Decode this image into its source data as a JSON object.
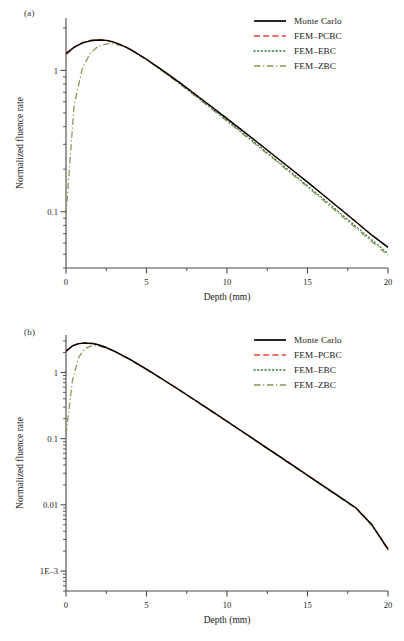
{
  "figure": {
    "panels": [
      {
        "tag": "(a)",
        "xlabel": "Depth (mm)",
        "ylabel": "Normalized fluence rate"
      },
      {
        "tag": "(b)",
        "xlabel": "Depth (mm)",
        "ylabel": "Normalized fluence rate"
      }
    ],
    "legend": {
      "entries": [
        {
          "label": "Monte Carlo",
          "color": "#000000",
          "style": "solid"
        },
        {
          "label": "FEM–PCBC",
          "color": "#e8413a",
          "style": "dashed"
        },
        {
          "label": "FEM–EBC",
          "color": "#2f7d3a",
          "style": "dotted"
        },
        {
          "label": "FEM–ZBC",
          "color": "#8f9152",
          "style": "dashdot"
        }
      ]
    }
  },
  "chart_data": [
    {
      "type": "line",
      "title": "(a)",
      "xlabel": "Depth (mm)",
      "ylabel": "Normalized fluence rate",
      "xlim": [
        0,
        20
      ],
      "ylim": [
        0.04,
        2.2
      ],
      "yscale": "log",
      "xticks": [
        0,
        5,
        10,
        15,
        20
      ],
      "xticklabels": [
        "0",
        "5",
        "10",
        "15",
        "20"
      ],
      "xminorticks": [
        2.5,
        7.5,
        12.5,
        17.5
      ],
      "yticks": [
        1,
        0.1
      ],
      "yticklabels": [
        "1",
        "0.1"
      ],
      "grid": false,
      "legend_position": "top-right",
      "x": [
        0,
        0.5,
        1,
        1.5,
        2,
        2.5,
        3,
        3.5,
        4,
        5,
        6,
        7,
        8,
        9,
        10,
        11,
        12,
        13,
        14,
        15,
        16,
        17,
        18,
        19,
        20
      ],
      "series": [
        {
          "name": "Monte Carlo",
          "color": "#000000",
          "style": "solid",
          "values": [
            1.32,
            1.46,
            1.56,
            1.62,
            1.64,
            1.63,
            1.58,
            1.5,
            1.41,
            1.2,
            1.0,
            0.83,
            0.68,
            0.558,
            0.456,
            0.372,
            0.303,
            0.246,
            0.2,
            0.162,
            0.131,
            0.1055,
            0.085,
            0.0683,
            0.056
          ]
        },
        {
          "name": "FEM–PCBC",
          "color": "#e8413a",
          "style": "dashed",
          "values": [
            1.29,
            1.45,
            1.57,
            1.63,
            1.66,
            1.64,
            1.59,
            1.51,
            1.41,
            1.2,
            1.0,
            0.83,
            0.681,
            0.558,
            0.456,
            0.372,
            0.303,
            0.246,
            0.2,
            0.162,
            0.131,
            0.1055,
            0.085,
            0.0683,
            0.0562
          ]
        },
        {
          "name": "FEM–EBC",
          "color": "#2f7d3a",
          "style": "dotted",
          "values": [
            1.3,
            1.45,
            1.56,
            1.62,
            1.64,
            1.63,
            1.58,
            1.5,
            1.4,
            1.19,
            0.99,
            0.818,
            0.668,
            0.545,
            0.443,
            0.359,
            0.291,
            0.235,
            0.19,
            0.153,
            0.123,
            0.0985,
            0.079,
            0.0632,
            0.0508
          ]
        },
        {
          "name": "FEM–ZBC",
          "color": "#8f9152",
          "style": "dashdot",
          "values": [
            0.095,
            0.56,
            1.02,
            1.32,
            1.48,
            1.54,
            1.54,
            1.49,
            1.4,
            1.19,
            0.985,
            0.812,
            0.662,
            0.539,
            0.437,
            0.354,
            0.286,
            0.231,
            0.186,
            0.15,
            0.12,
            0.096,
            0.0768,
            0.0613,
            0.0492
          ]
        }
      ]
    },
    {
      "type": "line",
      "title": "(b)",
      "xlabel": "Depth (mm)",
      "ylabel": "Normalized fluence rate",
      "xlim": [
        0,
        20
      ],
      "ylim": [
        0.0005,
        3.2
      ],
      "yscale": "log",
      "xticks": [
        0,
        5,
        10,
        15,
        20
      ],
      "xticklabels": [
        "0",
        "5",
        "10",
        "15",
        "20"
      ],
      "xminorticks": [
        2.5,
        7.5,
        12.5,
        17.5
      ],
      "yticks": [
        1,
        0.1,
        0.01,
        0.001
      ],
      "yticklabels": [
        "1",
        "0.1",
        "0.01",
        "1E–3"
      ],
      "grid": false,
      "legend_position": "top-right",
      "x": [
        0,
        0.4,
        0.8,
        1.2,
        1.6,
        2,
        2.5,
        3,
        4,
        5,
        6,
        7,
        8,
        9,
        10,
        11,
        12,
        13,
        14,
        15,
        16,
        17,
        18,
        19,
        20
      ],
      "series": [
        {
          "name": "Monte Carlo",
          "color": "#000000",
          "style": "solid",
          "values": [
            2.1,
            2.52,
            2.72,
            2.78,
            2.74,
            2.62,
            2.38,
            2.1,
            1.56,
            1.12,
            0.79,
            0.552,
            0.383,
            0.265,
            0.183,
            0.126,
            0.0865,
            0.0594,
            0.0408,
            0.028,
            0.0192,
            0.0132,
            0.00905,
            0.005,
            0.00215
          ]
        },
        {
          "name": "FEM–PCBC",
          "color": "#e8413a",
          "style": "dashed",
          "values": [
            2.06,
            2.54,
            2.76,
            2.82,
            2.77,
            2.64,
            2.39,
            2.11,
            1.57,
            1.12,
            0.792,
            0.553,
            0.384,
            0.266,
            0.183,
            0.126,
            0.0868,
            0.0596,
            0.0409,
            0.0281,
            0.0193,
            0.0132,
            0.00908,
            0.00502,
            0.00218
          ]
        },
        {
          "name": "FEM–EBC",
          "color": "#2f7d3a",
          "style": "dotted",
          "values": [
            2.08,
            2.52,
            2.73,
            2.79,
            2.74,
            2.62,
            2.37,
            2.09,
            1.55,
            1.11,
            0.785,
            0.548,
            0.38,
            0.263,
            0.181,
            0.125,
            0.0858,
            0.0589,
            0.0404,
            0.0277,
            0.019,
            0.013,
            0.00895,
            0.00495,
            0.0021
          ]
        },
        {
          "name": "FEM–ZBC",
          "color": "#8f9152",
          "style": "dashdot",
          "values": [
            0.115,
            0.76,
            1.72,
            2.32,
            2.52,
            2.52,
            2.33,
            2.07,
            1.54,
            1.1,
            0.78,
            0.545,
            0.378,
            0.261,
            0.18,
            0.124,
            0.0852,
            0.0585,
            0.0401,
            0.0275,
            0.0188,
            0.0129,
            0.00888,
            0.0049,
            0.00208
          ]
        }
      ]
    }
  ]
}
